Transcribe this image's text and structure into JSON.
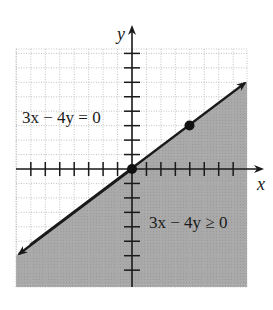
{
  "figure": {
    "type": "linear-inequality-graph",
    "axes": {
      "x_label": "x",
      "y_label": "y",
      "x_range": [
        -8,
        8
      ],
      "y_range": [
        -8,
        8
      ],
      "tick_spacing": 1,
      "grid": "dotted"
    },
    "boundary_line": {
      "equation_label": "3x − 4y = 0",
      "slope": 0.75,
      "intercept": 0,
      "style": "solid",
      "arrows": "both"
    },
    "shaded_region": {
      "inequality_label": "3x − 4y ≥ 0",
      "side": "below",
      "fill_color": "#a9a9a9"
    },
    "points": [
      {
        "label": "origin",
        "x": 0,
        "y": 0
      },
      {
        "label": "test-point",
        "x": 4,
        "y": 3
      }
    ],
    "colors": {
      "background": "#ffffff",
      "grid": "#b5b5b5",
      "axis": "#1a1a1a",
      "shade": "#a9a9a9"
    }
  }
}
